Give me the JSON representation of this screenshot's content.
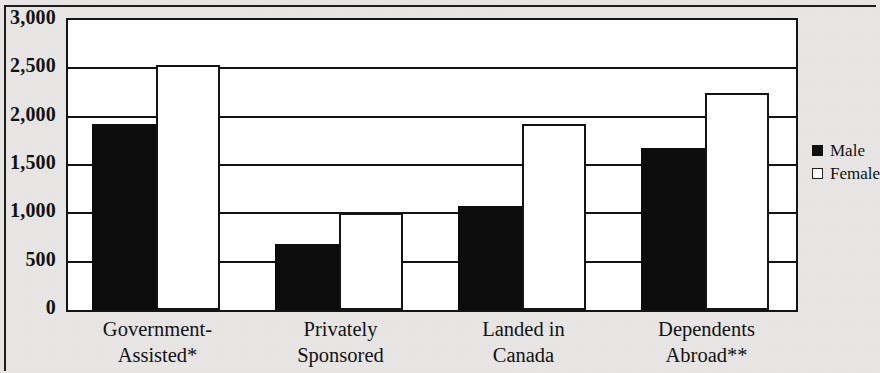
{
  "chart_data": {
    "type": "bar",
    "title": "",
    "subtitle": "",
    "xlabel": "",
    "ylabel": "",
    "ylim": [
      0,
      3000
    ],
    "y_ticks": [
      0,
      500,
      1000,
      1500,
      2000,
      2500,
      3000
    ],
    "y_tick_labels": [
      "0",
      "500",
      "1,000",
      "1,500",
      "2,000",
      "2,500",
      "3,000"
    ],
    "grid": true,
    "legend_position": "right",
    "categories": [
      "Government-Assisted*",
      "Privately Sponsored",
      "Landed in Canada",
      "Dependents Abroad**"
    ],
    "category_lines": [
      [
        "Government-",
        "Assisted*"
      ],
      [
        "Privately",
        "Sponsored"
      ],
      [
        "Landed in",
        "Canada"
      ],
      [
        "Dependents",
        "Abroad**"
      ]
    ],
    "series": [
      {
        "name": "Male",
        "color": "#0c0c0c",
        "values": [
          1920,
          680,
          1080,
          1680
        ]
      },
      {
        "name": "Female",
        "color": "#ffffff",
        "values": [
          2530,
          1000,
          1920,
          2250
        ]
      }
    ],
    "annotations": [
      "*",
      "**"
    ]
  },
  "legend": {
    "items": [
      {
        "label": "Male",
        "swatch": "filled-square-icon"
      },
      {
        "label": "Female",
        "swatch": "open-square-icon"
      }
    ]
  },
  "colors": {
    "male_fill": "#0c0c0c",
    "female_fill": "#ffffff",
    "axis": "#141414",
    "page_background": "#e9e8e6",
    "plot_background": "#ffffff",
    "text": "#121212"
  }
}
